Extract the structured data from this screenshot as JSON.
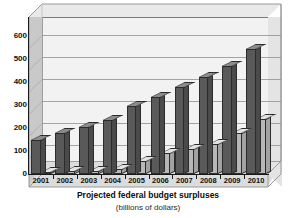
{
  "chart_data": {
    "type": "bar",
    "title": "Projected federal budget surpluses",
    "subtitle": "(billions of dollars)",
    "xlabel": "",
    "ylabel": "",
    "ylim": [
      0,
      600
    ],
    "ytick_step": 100,
    "grid": true,
    "legend_position": "none",
    "style": "3d-clustered-column",
    "categories": [
      "2001",
      "2002",
      "2003",
      "2004",
      "2005",
      "2006",
      "2007",
      "2008",
      "2009",
      "2010"
    ],
    "yticks": [
      "0",
      "100",
      "200",
      "300",
      "400",
      "500",
      "600"
    ],
    "series": [
      {
        "name": "Total projected surplus",
        "color": "#595959",
        "values": [
          150,
          180,
          205,
          235,
          295,
          335,
          380,
          420,
          470,
          545
        ]
      },
      {
        "name": "Social Security surplus",
        "color": "#b8b8b8",
        "values": [
          10,
          12,
          15,
          22,
          55,
          90,
          110,
          130,
          180,
          240
        ]
      }
    ]
  },
  "axes": {
    "y_ticks": [
      "600",
      "500",
      "400",
      "300",
      "200",
      "100",
      "0"
    ],
    "x_ticks": [
      "2001",
      "2002",
      "2003",
      "2004",
      "2005",
      "2006",
      "2007",
      "2008",
      "2009",
      "2010"
    ]
  },
  "captions": {
    "title": "Projected federal budget surpluses",
    "subtitle": "(billions of dollars)"
  },
  "colors": {
    "series_dark": "#595959",
    "series_light": "#b8b8b8",
    "plot_background": "#f2f2f2",
    "floor": "#dcdcdc",
    "gridline": "#8a8a8a",
    "axis": "#1a1a1a"
  }
}
